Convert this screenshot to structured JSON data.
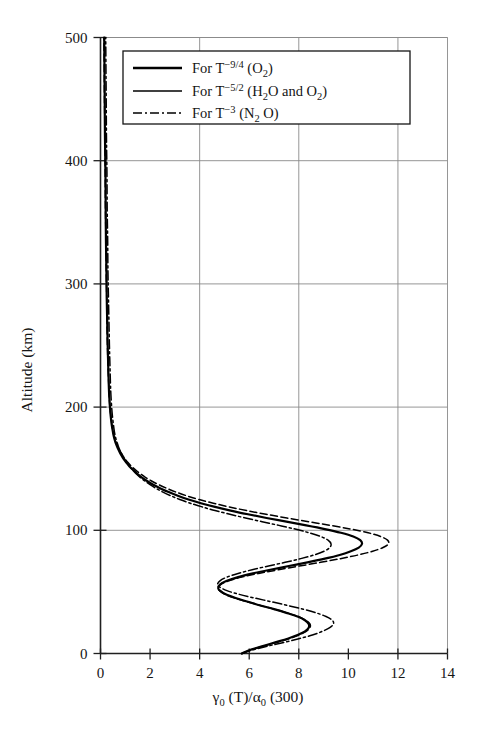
{
  "chart_data": {
    "type": "line",
    "title": "",
    "xlabel": "γ₀ (T)/α₀ (300)",
    "ylabel": "Altitude (km)",
    "xlim": [
      0,
      14
    ],
    "ylim": [
      0,
      500
    ],
    "xticks": [
      0,
      2,
      4,
      6,
      8,
      10,
      12,
      14
    ],
    "yticks": [
      0,
      100,
      200,
      300,
      400,
      500
    ],
    "xticklabels": [
      "0",
      "2",
      "4",
      "6",
      "8",
      "10",
      "12",
      "14"
    ],
    "yticklabels": [
      "0",
      "100",
      "200",
      "300",
      "400",
      "500"
    ],
    "grid": true,
    "gridlines_x": [
      0,
      4,
      8,
      12
    ],
    "gridlines_y": [
      0,
      100,
      200,
      300,
      400,
      500
    ],
    "legend_position": "upper-center",
    "x_is_value_axis": true,
    "note": "x = gamma0(T)/alpha0(300) ratio, y = altitude in km; curves are plotted as x(y)",
    "series": [
      {
        "name": "For T^-9/4 (O2)",
        "style": "solid",
        "width": 2.2,
        "color": "#000000",
        "points": [
          [
            5.7,
            0
          ],
          [
            6.05,
            3
          ],
          [
            6.55,
            6
          ],
          [
            7.05,
            9
          ],
          [
            7.55,
            12
          ],
          [
            7.95,
            15
          ],
          [
            8.25,
            18
          ],
          [
            8.4,
            21
          ],
          [
            8.4,
            24
          ],
          [
            8.25,
            27
          ],
          [
            7.95,
            30
          ],
          [
            7.5,
            33
          ],
          [
            7.0,
            36
          ],
          [
            6.45,
            39
          ],
          [
            5.95,
            42
          ],
          [
            5.45,
            45
          ],
          [
            5.05,
            48
          ],
          [
            4.82,
            51
          ],
          [
            4.75,
            53
          ],
          [
            4.82,
            56
          ],
          [
            5.1,
            59
          ],
          [
            5.55,
            62
          ],
          [
            6.15,
            65
          ],
          [
            6.85,
            68
          ],
          [
            7.6,
            71
          ],
          [
            8.35,
            74
          ],
          [
            9.05,
            77
          ],
          [
            9.65,
            80
          ],
          [
            10.1,
            83
          ],
          [
            10.42,
            86
          ],
          [
            10.55,
            89
          ],
          [
            10.48,
            92
          ],
          [
            10.2,
            95
          ],
          [
            9.7,
            98
          ],
          [
            9.05,
            101
          ],
          [
            8.3,
            104
          ],
          [
            7.5,
            107
          ],
          [
            6.7,
            110
          ],
          [
            5.95,
            113
          ],
          [
            5.25,
            116
          ],
          [
            4.62,
            119
          ],
          [
            4.05,
            122
          ],
          [
            3.55,
            125
          ],
          [
            3.12,
            128
          ],
          [
            2.75,
            131
          ],
          [
            2.42,
            134
          ],
          [
            2.13,
            137
          ],
          [
            1.88,
            140
          ],
          [
            1.66,
            143
          ],
          [
            1.47,
            146
          ],
          [
            1.31,
            149
          ],
          [
            1.16,
            152
          ],
          [
            1.04,
            155
          ],
          [
            0.93,
            158
          ],
          [
            0.84,
            161
          ],
          [
            0.76,
            164
          ],
          [
            0.69,
            167
          ],
          [
            0.63,
            170
          ],
          [
            0.58,
            173
          ],
          [
            0.54,
            176
          ],
          [
            0.5,
            180
          ],
          [
            0.45,
            186
          ],
          [
            0.41,
            193
          ],
          [
            0.38,
            200
          ],
          [
            0.35,
            210
          ],
          [
            0.33,
            220
          ],
          [
            0.31,
            235
          ],
          [
            0.29,
            250
          ],
          [
            0.27,
            270
          ],
          [
            0.25,
            290
          ],
          [
            0.24,
            310
          ],
          [
            0.22,
            335
          ],
          [
            0.21,
            360
          ],
          [
            0.2,
            390
          ],
          [
            0.18,
            420
          ],
          [
            0.17,
            450
          ],
          [
            0.16,
            475
          ],
          [
            0.15,
            500
          ]
        ]
      },
      {
        "name": "For T^-5/2 (H2O and O2)",
        "style": "dashed",
        "width": 1.5,
        "color": "#000000",
        "points": [
          [
            5.72,
            0
          ],
          [
            6.08,
            3
          ],
          [
            6.58,
            6
          ],
          [
            7.1,
            9
          ],
          [
            7.6,
            12
          ],
          [
            8.0,
            15
          ],
          [
            8.3,
            18
          ],
          [
            8.45,
            21
          ],
          [
            8.45,
            24
          ],
          [
            8.28,
            27
          ],
          [
            7.98,
            30
          ],
          [
            7.52,
            33
          ],
          [
            7.0,
            36
          ],
          [
            6.45,
            39
          ],
          [
            5.92,
            42
          ],
          [
            5.42,
            45
          ],
          [
            5.02,
            48
          ],
          [
            4.8,
            51
          ],
          [
            4.74,
            53
          ],
          [
            4.85,
            56
          ],
          [
            5.18,
            59
          ],
          [
            5.7,
            62
          ],
          [
            6.38,
            65
          ],
          [
            7.18,
            68
          ],
          [
            8.02,
            71
          ],
          [
            8.88,
            74
          ],
          [
            9.68,
            77
          ],
          [
            10.4,
            80
          ],
          [
            10.98,
            83
          ],
          [
            11.4,
            86
          ],
          [
            11.62,
            89
          ],
          [
            11.58,
            92
          ],
          [
            11.3,
            95
          ],
          [
            10.8,
            98
          ],
          [
            10.1,
            101
          ],
          [
            9.28,
            104
          ],
          [
            8.4,
            107
          ],
          [
            7.52,
            110
          ],
          [
            6.68,
            113
          ],
          [
            5.9,
            116
          ],
          [
            5.18,
            119
          ],
          [
            4.55,
            122
          ],
          [
            3.98,
            125
          ],
          [
            3.48,
            128
          ],
          [
            3.05,
            131
          ],
          [
            2.68,
            134
          ],
          [
            2.35,
            137
          ],
          [
            2.06,
            140
          ],
          [
            1.81,
            143
          ],
          [
            1.6,
            146
          ],
          [
            1.41,
            149
          ],
          [
            1.25,
            152
          ],
          [
            1.11,
            155
          ],
          [
            0.99,
            158
          ],
          [
            0.89,
            161
          ],
          [
            0.8,
            164
          ],
          [
            0.72,
            167
          ],
          [
            0.65,
            170
          ],
          [
            0.6,
            173
          ],
          [
            0.55,
            176
          ],
          [
            0.51,
            180
          ],
          [
            0.46,
            186
          ],
          [
            0.42,
            193
          ],
          [
            0.38,
            200
          ],
          [
            0.35,
            210
          ],
          [
            0.33,
            220
          ],
          [
            0.3,
            235
          ],
          [
            0.28,
            250
          ],
          [
            0.26,
            270
          ],
          [
            0.25,
            290
          ],
          [
            0.23,
            310
          ],
          [
            0.22,
            335
          ],
          [
            0.2,
            360
          ],
          [
            0.19,
            390
          ],
          [
            0.18,
            420
          ],
          [
            0.16,
            450
          ],
          [
            0.15,
            475
          ],
          [
            0.14,
            500
          ]
        ]
      },
      {
        "name": "For T^-3 (N2 O)",
        "style": "dashdot",
        "width": 1.5,
        "color": "#000000",
        "points": [
          [
            5.7,
            0
          ],
          [
            6.15,
            3
          ],
          [
            6.75,
            6
          ],
          [
            7.4,
            9
          ],
          [
            8.0,
            12
          ],
          [
            8.55,
            15
          ],
          [
            8.95,
            18
          ],
          [
            9.25,
            21
          ],
          [
            9.4,
            24
          ],
          [
            9.35,
            27
          ],
          [
            9.1,
            30
          ],
          [
            8.7,
            33
          ],
          [
            8.18,
            36
          ],
          [
            7.55,
            39
          ],
          [
            6.9,
            42
          ],
          [
            6.22,
            45
          ],
          [
            5.6,
            48
          ],
          [
            5.1,
            51
          ],
          [
            4.8,
            54
          ],
          [
            4.72,
            56
          ],
          [
            4.82,
            59
          ],
          [
            5.1,
            62
          ],
          [
            5.55,
            65
          ],
          [
            6.12,
            68
          ],
          [
            6.78,
            71
          ],
          [
            7.45,
            74
          ],
          [
            8.08,
            77
          ],
          [
            8.62,
            80
          ],
          [
            9.02,
            83
          ],
          [
            9.25,
            86
          ],
          [
            9.3,
            89
          ],
          [
            9.18,
            92
          ],
          [
            8.88,
            95
          ],
          [
            8.42,
            98
          ],
          [
            7.85,
            101
          ],
          [
            7.2,
            104
          ],
          [
            6.52,
            107
          ],
          [
            5.85,
            110
          ],
          [
            5.22,
            113
          ],
          [
            4.62,
            116
          ],
          [
            4.1,
            119
          ],
          [
            3.62,
            122
          ],
          [
            3.2,
            125
          ],
          [
            2.84,
            128
          ],
          [
            2.52,
            131
          ],
          [
            2.24,
            134
          ],
          [
            2.0,
            137
          ],
          [
            1.79,
            140
          ],
          [
            1.6,
            143
          ],
          [
            1.44,
            146
          ],
          [
            1.3,
            149
          ],
          [
            1.17,
            152
          ],
          [
            1.06,
            155
          ],
          [
            0.97,
            158
          ],
          [
            0.88,
            161
          ],
          [
            0.81,
            164
          ],
          [
            0.74,
            167
          ],
          [
            0.69,
            170
          ],
          [
            0.64,
            173
          ],
          [
            0.6,
            176
          ],
          [
            0.56,
            180
          ],
          [
            0.52,
            186
          ],
          [
            0.48,
            193
          ],
          [
            0.45,
            200
          ],
          [
            0.42,
            210
          ],
          [
            0.4,
            220
          ],
          [
            0.38,
            235
          ],
          [
            0.36,
            250
          ],
          [
            0.34,
            270
          ],
          [
            0.32,
            290
          ],
          [
            0.3,
            310
          ],
          [
            0.29,
            335
          ],
          [
            0.27,
            360
          ],
          [
            0.26,
            390
          ],
          [
            0.24,
            420
          ],
          [
            0.23,
            450
          ],
          [
            0.22,
            475
          ],
          [
            0.21,
            500
          ]
        ]
      }
    ]
  },
  "legend": {
    "entries": [
      {
        "prefix": "For T",
        "exponent": "−9/4",
        "suffix_pre": " (O",
        "suffix_sub": "2",
        "suffix_post": ")",
        "style": "solid-thick"
      },
      {
        "prefix": "For T",
        "exponent": "−5/2",
        "suffix_pre": " (H",
        "suffix_sub": "2",
        "suffix_post": "O and O",
        "suffix_sub2": "2",
        "suffix_post2": ")",
        "style": "solid-thin"
      },
      {
        "prefix": "For T",
        "exponent": "−3",
        "suffix_pre": " (N",
        "suffix_sub": "2",
        "suffix_post": " O)",
        "style": "dashdot"
      }
    ]
  },
  "axes": {
    "y_title": "Altitude (km)",
    "x_title_gamma": "γ",
    "x_title_sub0": "0",
    "x_title_mid": " (T)/",
    "x_title_alpha": "α",
    "x_title_sub0b": "0",
    "x_title_end": " (300)"
  },
  "colors": {
    "line": "#000000",
    "grid": "#8a8a8a",
    "axis": "#202020",
    "background": "#ffffff"
  }
}
